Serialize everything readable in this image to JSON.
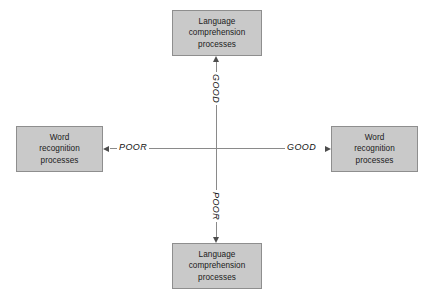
{
  "diagram": {
    "colors": {
      "box_fill": "#c9c9c9",
      "box_border": "#8e8e8e",
      "axis_line": "#8a8a8a",
      "arrow": "#4d4d4d",
      "text": "#1a1a1a",
      "background": "#ffffff"
    },
    "nodes": {
      "top": {
        "lines": [
          "Language",
          "comprehension",
          "processes"
        ],
        "line1": "Language",
        "line2": "comprehension",
        "line3": "processes"
      },
      "bottom": {
        "lines": [
          "Language",
          "comprehension",
          "processes"
        ],
        "line1": "Language",
        "line2": "comprehension",
        "line3": "processes"
      },
      "left": {
        "lines": [
          "Word",
          "recognition",
          "processes"
        ],
        "line1": "Word",
        "line2": "recognition",
        "line3": "processes"
      },
      "right": {
        "lines": [
          "Word",
          "recognition",
          "processes"
        ],
        "line1": "Word",
        "line2": "recognition",
        "line3": "processes"
      }
    },
    "axis_labels": {
      "vertical_top": "GOOD",
      "vertical_bottom": "POOR",
      "horizontal_left": "POOR",
      "horizontal_right": "GOOD"
    },
    "arrows": {
      "up": "arrow-up-icon",
      "down": "arrow-down-icon",
      "left": "arrow-left-icon",
      "right": "arrow-right-icon"
    }
  }
}
